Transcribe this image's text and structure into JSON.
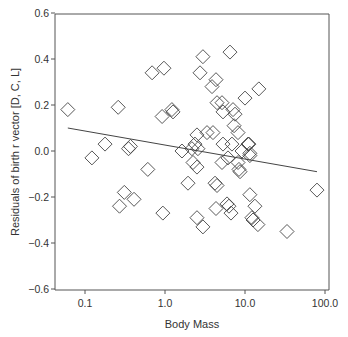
{
  "chart_data": {
    "type": "scatter",
    "title": "",
    "xlabel": "Body Mass",
    "ylabel": "Residuals of birth r vector [D, C, L]",
    "xscale": "log",
    "xlim": [
      0.05,
      110
    ],
    "ylim": [
      -0.6,
      0.6
    ],
    "grid": false,
    "legend": null,
    "x_ticks": [
      {
        "value": 0.1,
        "label": "0.1"
      },
      {
        "value": 1.0,
        "label": "1.0"
      },
      {
        "value": 10.0,
        "label": "10.0"
      },
      {
        "value": 100.0,
        "label": "100.0"
      }
    ],
    "y_ticks": [
      {
        "value": 0.6,
        "label": "0.6"
      },
      {
        "value": 0.4,
        "label": "0.4"
      },
      {
        "value": 0.2,
        "label": "0.2"
      },
      {
        "value": 0.0,
        "label": "0.0"
      },
      {
        "value": -0.2,
        "label": "−0.2"
      },
      {
        "value": -0.4,
        "label": "−0.4"
      },
      {
        "value": -0.6,
        "label": "−0.6"
      }
    ],
    "marker": "open-diamond",
    "series": [
      {
        "name": "species",
        "points": [
          [
            0.061,
            0.18
          ],
          [
            0.122,
            -0.03
          ],
          [
            0.178,
            0.03
          ],
          [
            0.35,
            0.01
          ],
          [
            0.37,
            0.02
          ],
          [
            0.26,
            0.19
          ],
          [
            0.61,
            -0.08
          ],
          [
            0.31,
            -0.18
          ],
          [
            0.41,
            -0.21
          ],
          [
            0.27,
            -0.24
          ],
          [
            0.69,
            0.34
          ],
          [
            0.97,
            0.36
          ],
          [
            0.94,
            -0.27
          ],
          [
            0.92,
            0.15
          ],
          [
            1.22,
            0.18
          ],
          [
            1.26,
            0.17
          ],
          [
            1.63,
            0.0
          ],
          [
            2.17,
            0.01
          ],
          [
            2.37,
            0.03
          ],
          [
            1.94,
            -0.14
          ],
          [
            2.51,
            -0.07
          ],
          [
            2.24,
            -0.05
          ],
          [
            2.51,
            -0.29
          ],
          [
            2.98,
            -0.33
          ],
          [
            2.74,
            0.34
          ],
          [
            2.98,
            0.41
          ],
          [
            3.35,
            0.08
          ],
          [
            3.98,
            0.08
          ],
          [
            2.51,
            0.07
          ],
          [
            2.58,
            0.01
          ],
          [
            4.34,
            0.31
          ],
          [
            3.87,
            0.28
          ],
          [
            4.47,
            0.21
          ],
          [
            5.16,
            0.21
          ],
          [
            5.31,
            0.17
          ],
          [
            4.34,
            -0.25
          ],
          [
            4.22,
            -0.14
          ],
          [
            4.47,
            -0.15
          ],
          [
            5.16,
            -0.05
          ],
          [
            5.31,
            0.03
          ],
          [
            6.13,
            -0.03
          ],
          [
            5.96,
            -0.23
          ],
          [
            6.68,
            -0.27
          ],
          [
            6.49,
            0.43
          ],
          [
            7.08,
            0.18
          ],
          [
            7.5,
            0.16
          ],
          [
            7.3,
            0.11
          ],
          [
            8.18,
            0.08
          ],
          [
            6.87,
            0.03
          ],
          [
            8.18,
            -0.05
          ],
          [
            8.41,
            -0.08
          ],
          [
            8.66,
            -0.09
          ],
          [
            10.0,
            0.23
          ],
          [
            14.9,
            0.27
          ],
          [
            10.9,
            0.03
          ],
          [
            9.17,
            0.0
          ],
          [
            11.5,
            -0.01
          ],
          [
            11.2,
            0.03
          ],
          [
            11.5,
            -0.02
          ],
          [
            11.5,
            -0.19
          ],
          [
            13.3,
            -0.24
          ],
          [
            12.2,
            -0.29
          ],
          [
            12.6,
            -0.3
          ],
          [
            14.5,
            -0.32
          ],
          [
            33.5,
            -0.35
          ],
          [
            79.4,
            -0.17
          ],
          [
            6.3,
            -0.24
          ]
        ]
      }
    ],
    "trendline": {
      "type": "linear-log",
      "from": [
        0.061,
        0.1
      ],
      "to": [
        79.4,
        -0.09
      ]
    }
  },
  "colors": {
    "axis": "#555555",
    "marker_stroke": "#444444",
    "line": "#444444",
    "background": "#ffffff"
  }
}
